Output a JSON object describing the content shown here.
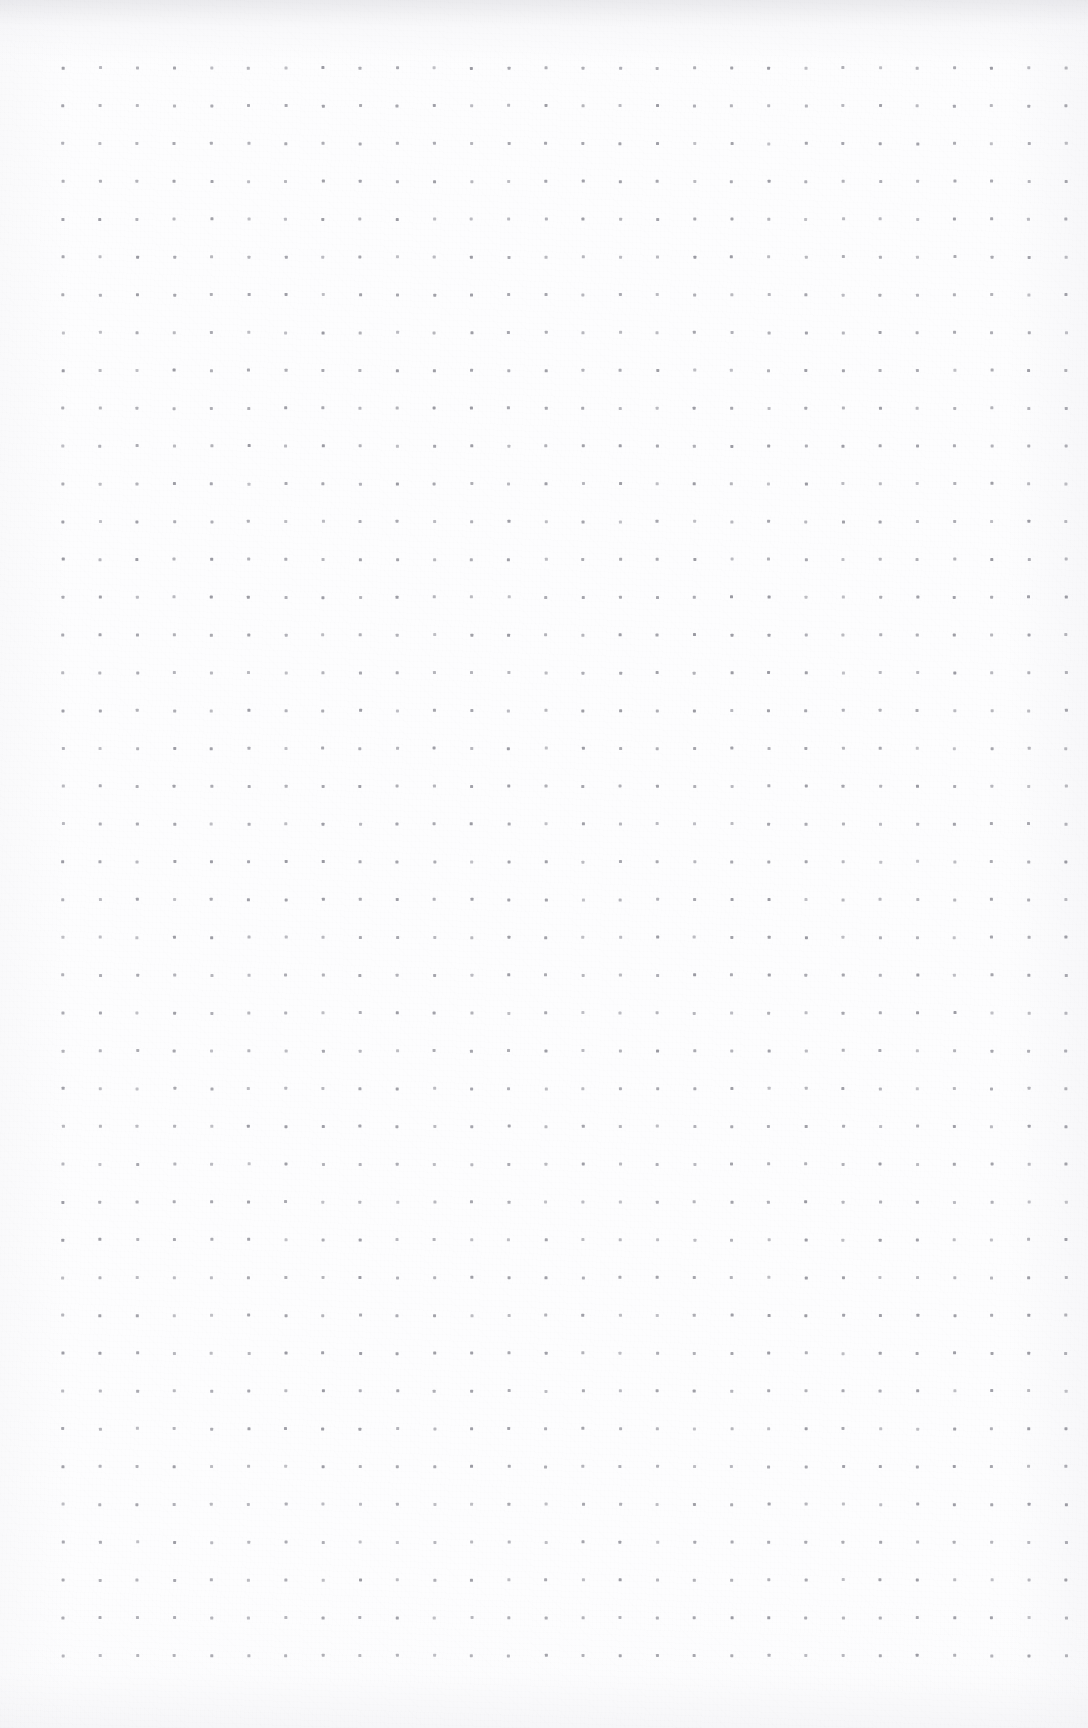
{
  "page": {
    "kind": "dot-grid-notebook-page",
    "width_px": 1088,
    "height_px": 1728,
    "background_color": "#fdfdfe",
    "paper_edge_tone_color": "#e8e8ec"
  },
  "grid": {
    "label": "dot grid",
    "dot_color": "#9a9aa2",
    "dot_size_px": 3,
    "columns": 28,
    "rows": 43,
    "origin_x_px": 63,
    "origin_y_px": 68,
    "spacing_x_px": 37.15,
    "spacing_y_px": 37.8,
    "margin_left_px": 63,
    "margin_right_px": 22,
    "margin_top_px": 68,
    "margin_bottom_px": 73
  },
  "content": {
    "text_items": [],
    "has_handwriting": false,
    "has_printed_text": false,
    "notes_visible": ""
  }
}
